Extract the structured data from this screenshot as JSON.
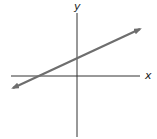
{
  "diagram": {
    "type": "coordinate-plane-line",
    "x_axis_label": "x",
    "y_axis_label": "y",
    "line": {
      "description": "straight line with positive slope and positive y-intercept, arrows at both ends",
      "slope_sign": "positive",
      "y_intercept_sign": "positive",
      "x_intercept_sign": "negative"
    },
    "colors": {
      "axes": "#333333",
      "line": "#6e6e6e",
      "background": "#ffffff"
    }
  }
}
